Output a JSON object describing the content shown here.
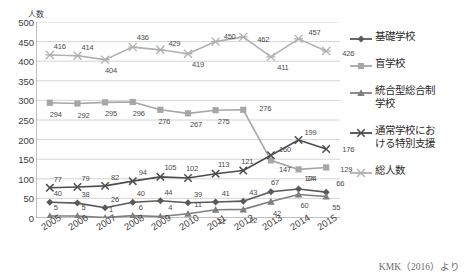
{
  "axis_title": "人数",
  "source_note": "KMK（2016）より",
  "legend": {
    "items": [
      {
        "label": "基礎学校",
        "color": "#595959",
        "marker": "diamond"
      },
      {
        "label": "盲学校",
        "color": "#a6a6a6",
        "marker": "square"
      },
      {
        "label": "統合型総合制\n学校",
        "color": "#7f7f7f",
        "marker": "triangle"
      },
      {
        "label": "通常学校にお\nける特別支援",
        "color": "#4d4d4d",
        "marker": "cross"
      },
      {
        "label": "総人数",
        "color": "#b0b0b0",
        "marker": "star"
      }
    ]
  },
  "chart_data": {
    "type": "line",
    "title": "",
    "xlabel": "",
    "ylabel": "人数",
    "ylim": [
      0,
      500
    ],
    "yticks": [
      0,
      50,
      100,
      150,
      200,
      250,
      300,
      350,
      400,
      450,
      500
    ],
    "grid": true,
    "legend_position": "right",
    "categories": [
      "2005",
      "2006",
      "2007",
      "2008",
      "2009",
      "2010",
      "2011",
      "2012",
      "2013",
      "2014",
      "2015"
    ],
    "series": [
      {
        "name": "基礎学校",
        "color": "#595959",
        "marker": "diamond",
        "values": [
          40,
          38,
          26,
          40,
          44,
          39,
          41,
          43,
          67,
          74,
          66
        ]
      },
      {
        "name": "盲学校",
        "color": "#a6a6a6",
        "marker": "square",
        "values": [
          294,
          292,
          295,
          296,
          276,
          267,
          275,
          276,
          147,
          124,
          129
        ]
      },
      {
        "name": "統合型総合制学校",
        "color": "#7f7f7f",
        "marker": "triangle",
        "values": [
          5,
          5,
          1,
          6,
          4,
          11,
          21,
          22,
          42,
          60,
          55
        ]
      },
      {
        "name": "通常学校における特別支援",
        "color": "#4d4d4d",
        "marker": "cross",
        "values": [
          77,
          79,
          82,
          94,
          105,
          102,
          113,
          121,
          160,
          199,
          176
        ]
      },
      {
        "name": "総人数",
        "color": "#b0b0b0",
        "marker": "star",
        "values": [
          416,
          414,
          404,
          436,
          429,
          419,
          450,
          462,
          411,
          457,
          426
        ]
      }
    ],
    "label_offsets": {
      "基礎学校": [
        [
          8,
          -9
        ],
        [
          8,
          -9
        ],
        [
          10,
          -9
        ],
        [
          8,
          -9
        ],
        [
          8,
          -9
        ],
        [
          10,
          -9
        ],
        [
          10,
          -9
        ],
        [
          10,
          -9
        ],
        [
          4,
          -10
        ],
        [
          12,
          -11
        ],
        [
          14,
          -9
        ]
      ],
      "盲学校": [
        [
          6,
          11
        ],
        [
          6,
          11
        ],
        [
          6,
          11
        ],
        [
          6,
          11
        ],
        [
          4,
          11
        ],
        [
          8,
          11
        ],
        [
          8,
          11
        ],
        [
          22,
          -2
        ],
        [
          14,
          9
        ],
        [
          12,
          9
        ],
        [
          20,
          2
        ]
      ],
      "統合型総合制学校": [
        [
          6,
          -9
        ],
        [
          6,
          -9
        ],
        [
          6,
          -9
        ],
        [
          8,
          -9
        ],
        [
          10,
          -9
        ],
        [
          10,
          -10
        ],
        [
          6,
          11
        ],
        [
          10,
          11
        ],
        [
          6,
          11
        ],
        [
          6,
          11
        ],
        [
          10,
          11
        ]
      ],
      "通常学校における特別支援": [
        [
          8,
          -9
        ],
        [
          8,
          -9
        ],
        [
          10,
          -9
        ],
        [
          10,
          -9
        ],
        [
          10,
          -10
        ],
        [
          4,
          -10
        ],
        [
          8,
          -10
        ],
        [
          4,
          -10
        ],
        [
          14,
          -6
        ],
        [
          12,
          -8
        ],
        [
          22,
          0
        ]
      ],
      "総人数": [
        [
          10,
          -9
        ],
        [
          10,
          -9
        ],
        [
          6,
          10
        ],
        [
          10,
          -10
        ],
        [
          14,
          -7
        ],
        [
          10,
          10
        ],
        [
          14,
          -6
        ],
        [
          20,
          2
        ],
        [
          12,
          10
        ],
        [
          16,
          -7
        ],
        [
          22,
          2
        ]
      ]
    }
  }
}
